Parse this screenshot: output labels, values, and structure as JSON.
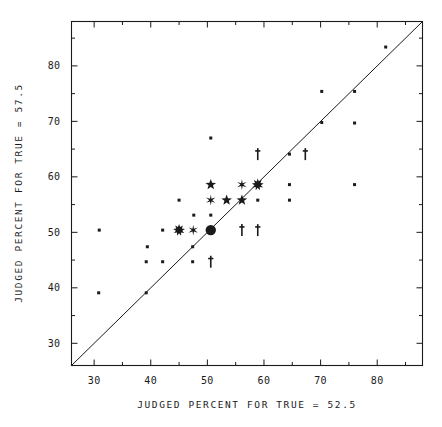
{
  "chart_data": {
    "type": "scatter",
    "title": "",
    "xlabel": "JUDGED PERCENT FOR TRUE = 52.5",
    "ylabel": "JUDGED PERCENT FOR TRUE = 57.5",
    "xlim": [
      26,
      88
    ],
    "ylim": [
      26,
      88
    ],
    "xticks": [
      30,
      40,
      50,
      60,
      70,
      80
    ],
    "yticks": [
      30,
      40,
      50,
      60,
      70,
      80
    ],
    "xtick_labels": [
      "30",
      "40",
      "50",
      "60",
      "70",
      "80"
    ],
    "ytick_labels": [
      "30",
      "40",
      "50",
      "60",
      "70",
      "80"
    ],
    "minor_tick_step": 5,
    "grid": false,
    "legend": "none",
    "reference_line": {
      "name": "identity-line",
      "type": "line",
      "x": [
        26,
        88
      ],
      "y": [
        26,
        88
      ],
      "description": "y = x diagonal"
    },
    "marker_kinds": {
      "dot": "small filled square point",
      "circle": "large filled circle",
      "star": "five-point star",
      "asterisk": "six-point asterisk",
      "burst": "many-point starburst",
      "dagger": "vertical bar with crossbar"
    },
    "points": [
      {
        "x": 30.9,
        "y": 50.4,
        "marker": "dot"
      },
      {
        "x": 30.8,
        "y": 39.1,
        "marker": "dot"
      },
      {
        "x": 39.2,
        "y": 39.1,
        "marker": "dot"
      },
      {
        "x": 39.4,
        "y": 47.4,
        "marker": "dot"
      },
      {
        "x": 39.2,
        "y": 44.7,
        "marker": "dot"
      },
      {
        "x": 42.1,
        "y": 50.4,
        "marker": "dot"
      },
      {
        "x": 42.1,
        "y": 44.7,
        "marker": "dot"
      },
      {
        "x": 45.0,
        "y": 50.4,
        "marker": "burst"
      },
      {
        "x": 45.0,
        "y": 55.8,
        "marker": "dot"
      },
      {
        "x": 47.5,
        "y": 50.4,
        "marker": "asterisk"
      },
      {
        "x": 47.4,
        "y": 47.4,
        "marker": "dot"
      },
      {
        "x": 47.4,
        "y": 44.7,
        "marker": "dot"
      },
      {
        "x": 47.6,
        "y": 53.1,
        "marker": "dot"
      },
      {
        "x": 50.6,
        "y": 50.4,
        "marker": "circle"
      },
      {
        "x": 50.6,
        "y": 53.1,
        "marker": "dot"
      },
      {
        "x": 50.6,
        "y": 58.6,
        "marker": "star"
      },
      {
        "x": 50.6,
        "y": 55.8,
        "marker": "asterisk"
      },
      {
        "x": 50.6,
        "y": 67.0,
        "marker": "dot"
      },
      {
        "x": 50.6,
        "y": 44.7,
        "marker": "dagger"
      },
      {
        "x": 53.4,
        "y": 55.8,
        "marker": "star"
      },
      {
        "x": 56.1,
        "y": 58.6,
        "marker": "asterisk"
      },
      {
        "x": 56.1,
        "y": 55.8,
        "marker": "star"
      },
      {
        "x": 56.1,
        "y": 50.4,
        "marker": "dagger"
      },
      {
        "x": 58.9,
        "y": 58.6,
        "marker": "burst"
      },
      {
        "x": 58.9,
        "y": 64.1,
        "marker": "dagger"
      },
      {
        "x": 58.9,
        "y": 55.8,
        "marker": "dot"
      },
      {
        "x": 58.9,
        "y": 50.4,
        "marker": "dagger"
      },
      {
        "x": 64.5,
        "y": 64.1,
        "marker": "dot"
      },
      {
        "x": 64.5,
        "y": 58.6,
        "marker": "dot"
      },
      {
        "x": 64.5,
        "y": 55.8,
        "marker": "dot"
      },
      {
        "x": 67.3,
        "y": 64.1,
        "marker": "dagger"
      },
      {
        "x": 70.2,
        "y": 75.4,
        "marker": "dot"
      },
      {
        "x": 70.2,
        "y": 69.8,
        "marker": "dot"
      },
      {
        "x": 76.0,
        "y": 75.4,
        "marker": "dot"
      },
      {
        "x": 76.0,
        "y": 69.7,
        "marker": "dot"
      },
      {
        "x": 76.0,
        "y": 58.6,
        "marker": "dot"
      },
      {
        "x": 81.5,
        "y": 83.4,
        "marker": "dot"
      }
    ]
  }
}
